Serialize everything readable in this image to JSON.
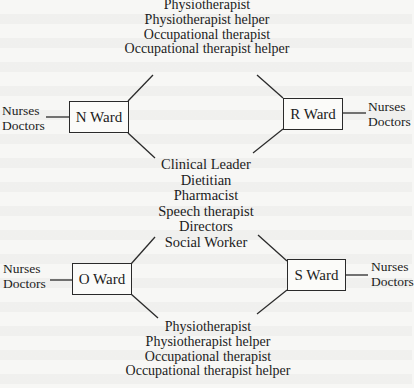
{
  "diagram": {
    "top_team": [
      "Physiotherapist",
      "Physiotherapist helper",
      "Occupational therapist",
      "Occupational therapist helper"
    ],
    "center_team": [
      "Clinical Leader",
      "Dietitian",
      "Pharmacist",
      "Speech therapist",
      "Directors",
      "Social Worker"
    ],
    "bottom_team": [
      "Physiotherapist",
      "Physiotherapist helper",
      "Occupational therapist",
      "Occupational therapist helper"
    ],
    "wards": {
      "n": {
        "label": "N Ward",
        "staff": [
          "Nurses",
          "Doctors"
        ]
      },
      "r": {
        "label": "R Ward",
        "staff": [
          "Nurses",
          "Doctors"
        ]
      },
      "o": {
        "label": "O Ward",
        "staff": [
          "Nurses",
          "Doctors"
        ]
      },
      "s": {
        "label": "S Ward",
        "staff": [
          "Nurses",
          "Doctors"
        ]
      }
    }
  }
}
